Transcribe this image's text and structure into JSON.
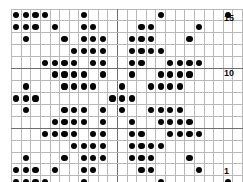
{
  "chart": {
    "title": "",
    "columns": 24,
    "rows": 15,
    "symbol": "filled-dot",
    "colors": {
      "dot": "#050505",
      "grid_line": "#b8b8b8",
      "border": "#6d6d6d",
      "background": "#ffffff"
    },
    "center_divider_after_column": 11,
    "row_labels": [
      {
        "row": 15,
        "label": "15"
      },
      {
        "row": 10,
        "label": "10"
      },
      {
        "row": 1,
        "label": "1"
      }
    ]
  },
  "chart_data": {
    "type": "heatmap",
    "title": "",
    "xlabel": "",
    "ylabel": "",
    "grid": true,
    "legend": "none",
    "x": [
      1,
      2,
      3,
      4,
      5,
      6,
      7,
      8,
      9,
      10,
      11,
      12,
      13,
      14,
      15,
      16,
      17,
      18,
      19,
      20,
      21,
      22,
      23,
      24
    ],
    "categories": [
      "15",
      "14",
      "13",
      "12",
      "11",
      "10",
      "9",
      "8",
      "7",
      "6",
      "5",
      "4",
      "3",
      "2",
      "1"
    ],
    "rows": [
      {
        "row": 15,
        "filled": [
          1,
          2,
          3,
          4,
          8,
          16,
          23
        ]
      },
      {
        "row": 14,
        "filled": [
          1,
          2,
          3,
          5,
          8,
          9,
          14,
          15,
          20
        ]
      },
      {
        "row": 13,
        "filled": [
          2,
          6,
          8,
          9,
          10,
          13,
          14,
          15,
          19
        ]
      },
      {
        "row": 12,
        "filled": [
          7,
          8,
          9,
          10,
          13,
          14,
          15,
          16
        ]
      },
      {
        "row": 11,
        "filled": [
          4,
          5,
          6,
          7,
          9,
          10,
          13,
          14,
          17,
          18,
          19,
          20
        ]
      },
      {
        "row": 10,
        "filled": [
          5,
          6,
          7,
          8,
          10,
          13,
          16,
          17,
          18,
          19
        ]
      },
      {
        "row": 9,
        "filled": [
          2,
          6,
          7,
          8,
          9,
          12,
          15,
          16,
          17,
          18
        ]
      },
      {
        "row": 8,
        "filled": [
          1,
          2,
          3,
          11,
          12,
          13
        ]
      },
      {
        "row": 7,
        "filled": [
          2,
          6,
          7,
          8,
          10,
          12,
          15,
          16,
          17,
          18
        ]
      },
      {
        "row": 6,
        "filled": [
          5,
          6,
          7,
          8,
          10,
          13,
          16,
          17,
          18,
          19
        ]
      },
      {
        "row": 5,
        "filled": [
          4,
          5,
          6,
          7,
          9,
          10,
          13,
          14,
          17,
          18,
          19,
          20
        ]
      },
      {
        "row": 4,
        "filled": [
          7,
          8,
          9,
          10,
          13,
          14,
          15,
          16
        ]
      },
      {
        "row": 3,
        "filled": [
          2,
          6,
          8,
          9,
          10,
          13,
          14,
          15,
          19
        ]
      },
      {
        "row": 2,
        "filled": [
          1,
          2,
          3,
          5,
          8,
          9,
          14,
          15,
          20
        ]
      },
      {
        "row": 1,
        "filled": [
          1,
          2,
          3,
          4,
          8,
          16,
          23
        ]
      }
    ]
  }
}
